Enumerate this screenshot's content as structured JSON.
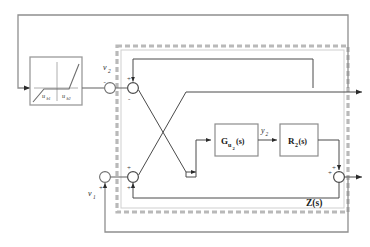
{
  "diagram": {
    "colors": {
      "line": "#4a4a4a",
      "line_dark": "#2b2b2b",
      "block_border": "#8c8c8c",
      "subsystem_border": "#b4b4b4",
      "text": "#1a1a1a",
      "background": "#ffffff"
    },
    "blocks": [
      {
        "id": "deadzone",
        "label": "",
        "kind": "nonlinearity-plot"
      },
      {
        "id": "g-u2",
        "label": "G",
        "sub": "u",
        "sub2": "2",
        "suffix": "(s)",
        "kind": "transfer-function"
      },
      {
        "id": "r2",
        "label": "R",
        "sub": "2",
        "suffix": "(s)",
        "kind": "transfer-function"
      }
    ],
    "block_labels": {
      "g_u2": "G",
      "g_u2_sub": "u",
      "g_u2_sub2": "2",
      "g_u2_suffix": "(s)",
      "r2": "R",
      "r2_sub": "2",
      "r2_suffix": "(s)",
      "subsystem": "Z(s)"
    },
    "signal_labels": {
      "v2": "v",
      "v2_sub": "2",
      "v1": "v",
      "v1_sub": "1",
      "y2": "y",
      "y2_sub": "2"
    },
    "nonlinearity_labels": {
      "left": "u",
      "left_sub": "b1",
      "right": "u",
      "right_sub": "b2"
    },
    "signs": {
      "sum_v2_minus": "-",
      "sum_top_plus": "+",
      "sum_top_minus": "-",
      "sum_v1_plus_left": "+",
      "sum_v1_plus_right": "+",
      "sum_bottom_plus": "+",
      "sum_right_plus_top": "+",
      "sum_right_plus_left": "+"
    },
    "summing_junctions": [
      {
        "id": "sum-v2",
        "cx": 110,
        "cy": 88
      },
      {
        "id": "sum-top",
        "cx": 133,
        "cy": 88
      },
      {
        "id": "sum-v1",
        "cx": 105,
        "cy": 177
      },
      {
        "id": "sum-inner",
        "cx": 133,
        "cy": 177
      },
      {
        "id": "sum-right",
        "cx": 339,
        "cy": 177
      }
    ]
  }
}
